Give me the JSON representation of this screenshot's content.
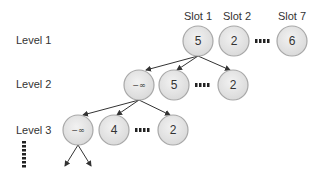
{
  "levels": [
    {
      "label": "Level 1",
      "x": 16,
      "y": 40
    },
    {
      "label": "Level 2",
      "x": 16,
      "y": 84
    },
    {
      "label": "Level 3",
      "x": 16,
      "y": 130
    }
  ],
  "slot_labels": [
    {
      "label": "Slot 1",
      "x": 198,
      "y": 16
    },
    {
      "label": "Slot 2",
      "x": 237,
      "y": 16
    },
    {
      "label": "Slot 7",
      "x": 292,
      "y": 16
    }
  ],
  "nodes": {
    "l1_slot1": {
      "value": "5",
      "cx": 198,
      "cy": 41
    },
    "l1_slot2": {
      "value": "2",
      "cx": 234,
      "cy": 41
    },
    "l1_slot7": {
      "value": "6",
      "cx": 292,
      "cy": 41
    },
    "l2_a": {
      "value": "−∞",
      "cx": 139,
      "cy": 85
    },
    "l2_b": {
      "value": "5",
      "cx": 174,
      "cy": 85
    },
    "l2_c": {
      "value": "2",
      "cx": 233,
      "cy": 85
    },
    "l3_a": {
      "value": "−∞",
      "cx": 78,
      "cy": 130
    },
    "l3_b": {
      "value": "4",
      "cx": 114,
      "cy": 130
    },
    "l3_c": {
      "value": "2",
      "cx": 173,
      "cy": 130
    }
  },
  "colors": {
    "node_fill": "#e4e4e4",
    "node_stroke": "#a8a8a8",
    "arrow": "#333333",
    "dots": "#222222"
  }
}
